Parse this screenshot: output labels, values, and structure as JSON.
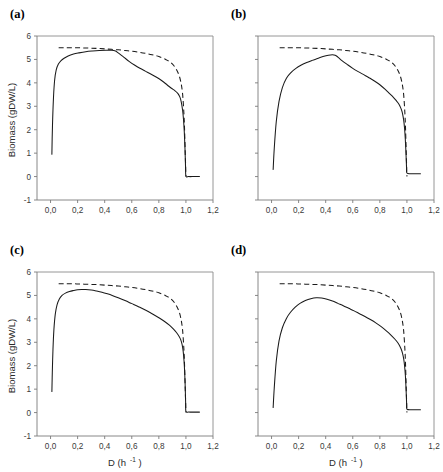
{
  "figure": {
    "name": "biomass-vs-dilution-rate-four-panel",
    "panels": [
      "a",
      "b",
      "c",
      "d"
    ]
  },
  "labels": {
    "panel_a": "(a)",
    "panel_b": "(b)",
    "panel_c": "(c)",
    "panel_d": "(d)",
    "ylabel": "Biomass (gDW/L)",
    "xlabel_base": "D (h",
    "xlabel_sup": "-1",
    "xlabel_close": ")",
    "xlabel_full": "D (h-1)"
  },
  "axes": {
    "ylim": [
      -1,
      6
    ],
    "yticks": [
      -1,
      0,
      1,
      2,
      3,
      4,
      5,
      6
    ],
    "ytick_labels": [
      "-1",
      "0",
      "1",
      "2",
      "3",
      "4",
      "5",
      "6"
    ],
    "xlim": [
      -0.1,
      1.2
    ],
    "xticks": [
      0.0,
      0.2,
      0.4,
      0.6,
      0.8,
      1.0,
      1.2
    ],
    "xtick_labels": [
      "0,0",
      "0,2",
      "0,4",
      "0,6",
      "0,8",
      "1,0",
      "1,2"
    ],
    "grid": false,
    "legend": "none",
    "decimal_separator": ","
  },
  "style": {
    "line_color": "#1a1a1a",
    "frame_color": "#8a8a8a",
    "background": "#ffffff"
  },
  "chart_data": [
    {
      "id": "a",
      "type": "line",
      "title": "(a)",
      "xlabel": "D (h-1)",
      "ylabel": "Biomass (gDW/L)",
      "xlim": [
        -0.1,
        1.2
      ],
      "ylim": [
        -1,
        6
      ],
      "grid": false,
      "legend": "none",
      "series": [
        {
          "name": "dashed-reference",
          "style": "dashed",
          "x": [
            0.06,
            0.1,
            0.15,
            0.2,
            0.25,
            0.3,
            0.35,
            0.4,
            0.45,
            0.5,
            0.55,
            0.6,
            0.65,
            0.7,
            0.75,
            0.8,
            0.85,
            0.88,
            0.91,
            0.94,
            0.96,
            0.975,
            0.985,
            0.99,
            0.995,
            1.0
          ],
          "y": [
            5.5,
            5.5,
            5.5,
            5.5,
            5.49,
            5.48,
            5.47,
            5.45,
            5.43,
            5.41,
            5.38,
            5.35,
            5.31,
            5.26,
            5.2,
            5.12,
            5.0,
            4.9,
            4.74,
            4.45,
            4.1,
            3.55,
            2.7,
            2.0,
            1.0,
            0.0
          ]
        },
        {
          "name": "solid-model",
          "style": "solid",
          "x": [
            0.01,
            0.012,
            0.016,
            0.022,
            0.03,
            0.042,
            0.058,
            0.078,
            0.1,
            0.13,
            0.17,
            0.21,
            0.26,
            0.31,
            0.36,
            0.41,
            0.45,
            0.48,
            0.5,
            0.54,
            0.58,
            0.62,
            0.66,
            0.7,
            0.74,
            0.78,
            0.82,
            0.86,
            0.89,
            0.92,
            0.94,
            0.955,
            0.965,
            0.975,
            0.982,
            0.988,
            0.993,
            0.997,
            1.0,
            1.02,
            1.06,
            1.1
          ],
          "y": [
            0.95,
            1.6,
            2.5,
            3.4,
            4.1,
            4.55,
            4.8,
            4.95,
            5.05,
            5.15,
            5.23,
            5.28,
            5.33,
            5.36,
            5.38,
            5.39,
            5.39,
            5.36,
            5.28,
            5.1,
            4.92,
            4.76,
            4.62,
            4.5,
            4.38,
            4.25,
            4.1,
            3.92,
            3.78,
            3.66,
            3.55,
            3.4,
            3.2,
            2.85,
            2.45,
            1.9,
            1.2,
            0.45,
            0.02,
            0.0,
            0.0,
            0.0
          ]
        }
      ]
    },
    {
      "id": "b",
      "type": "line",
      "title": "(b)",
      "xlabel": "D (h-1)",
      "ylabel": "Biomass (gDW/L)",
      "xlim": [
        -0.1,
        1.2
      ],
      "ylim": [
        -1,
        6
      ],
      "grid": false,
      "legend": "none",
      "series": [
        {
          "name": "dashed-reference",
          "style": "dashed",
          "x": [
            0.06,
            0.1,
            0.15,
            0.2,
            0.25,
            0.3,
            0.35,
            0.4,
            0.45,
            0.5,
            0.55,
            0.6,
            0.65,
            0.7,
            0.75,
            0.8,
            0.85,
            0.88,
            0.91,
            0.94,
            0.96,
            0.975,
            0.985,
            0.99,
            0.995,
            1.0
          ],
          "y": [
            5.5,
            5.5,
            5.5,
            5.5,
            5.49,
            5.48,
            5.47,
            5.45,
            5.43,
            5.41,
            5.38,
            5.35,
            5.31,
            5.26,
            5.2,
            5.12,
            5.0,
            4.9,
            4.74,
            4.45,
            4.1,
            3.55,
            2.7,
            2.0,
            1.0,
            0.0
          ]
        },
        {
          "name": "solid-model",
          "style": "solid",
          "x": [
            0.012,
            0.02,
            0.035,
            0.055,
            0.08,
            0.11,
            0.145,
            0.18,
            0.22,
            0.26,
            0.3,
            0.34,
            0.38,
            0.42,
            0.45,
            0.47,
            0.49,
            0.52,
            0.56,
            0.6,
            0.64,
            0.68,
            0.72,
            0.76,
            0.8,
            0.84,
            0.87,
            0.9,
            0.92,
            0.94,
            0.955,
            0.965,
            0.975,
            0.982,
            0.988,
            0.993,
            0.997,
            1.0,
            1.03,
            1.06,
            1.1
          ],
          "y": [
            0.3,
            1.2,
            2.35,
            3.2,
            3.8,
            4.2,
            4.45,
            4.62,
            4.76,
            4.87,
            4.96,
            5.04,
            5.12,
            5.18,
            5.2,
            5.18,
            5.1,
            4.95,
            4.78,
            4.62,
            4.48,
            4.35,
            4.22,
            4.08,
            3.92,
            3.72,
            3.55,
            3.38,
            3.25,
            3.1,
            2.92,
            2.75,
            2.45,
            2.1,
            1.6,
            1.0,
            0.4,
            0.15,
            0.12,
            0.12,
            0.12
          ]
        }
      ]
    },
    {
      "id": "c",
      "type": "line",
      "title": "(c)",
      "xlabel": "D (h-1)",
      "ylabel": "Biomass (gDW/L)",
      "xlim": [
        -0.1,
        1.2
      ],
      "ylim": [
        -1,
        6
      ],
      "grid": false,
      "legend": "none",
      "series": [
        {
          "name": "dashed-reference",
          "style": "dashed",
          "x": [
            0.06,
            0.1,
            0.15,
            0.2,
            0.25,
            0.3,
            0.35,
            0.4,
            0.45,
            0.5,
            0.55,
            0.6,
            0.65,
            0.7,
            0.75,
            0.8,
            0.85,
            0.88,
            0.91,
            0.94,
            0.96,
            0.975,
            0.985,
            0.99,
            0.995,
            1.0
          ],
          "y": [
            5.5,
            5.5,
            5.5,
            5.49,
            5.48,
            5.47,
            5.46,
            5.44,
            5.42,
            5.4,
            5.37,
            5.34,
            5.3,
            5.25,
            5.19,
            5.11,
            4.99,
            4.89,
            4.73,
            4.44,
            4.09,
            3.54,
            2.7,
            2.0,
            1.0,
            0.0
          ]
        },
        {
          "name": "solid-model",
          "style": "solid",
          "x": [
            0.01,
            0.013,
            0.018,
            0.025,
            0.035,
            0.048,
            0.065,
            0.085,
            0.11,
            0.14,
            0.17,
            0.2,
            0.23,
            0.26,
            0.3,
            0.34,
            0.38,
            0.42,
            0.46,
            0.5,
            0.55,
            0.6,
            0.65,
            0.7,
            0.75,
            0.8,
            0.84,
            0.88,
            0.91,
            0.93,
            0.95,
            0.962,
            0.972,
            0.98,
            0.986,
            0.991,
            0.995,
            0.998,
            1.0,
            1.02,
            1.06,
            1.1
          ],
          "y": [
            0.9,
            1.7,
            2.7,
            3.55,
            4.2,
            4.6,
            4.85,
            5.0,
            5.1,
            5.17,
            5.21,
            5.24,
            5.25,
            5.25,
            5.23,
            5.19,
            5.14,
            5.07,
            4.99,
            4.9,
            4.78,
            4.65,
            4.52,
            4.38,
            4.22,
            4.05,
            3.9,
            3.72,
            3.55,
            3.42,
            3.25,
            3.1,
            2.9,
            2.6,
            2.2,
            1.7,
            1.05,
            0.4,
            0.05,
            0.02,
            0.02,
            0.02
          ]
        }
      ]
    },
    {
      "id": "d",
      "type": "line",
      "title": "(d)",
      "xlabel": "D (h-1)",
      "ylabel": "Biomass (gDW/L)",
      "xlim": [
        -0.1,
        1.2
      ],
      "ylim": [
        -1,
        6
      ],
      "grid": false,
      "legend": "none",
      "series": [
        {
          "name": "dashed-reference",
          "style": "dashed",
          "x": [
            0.06,
            0.1,
            0.15,
            0.2,
            0.25,
            0.3,
            0.35,
            0.4,
            0.45,
            0.5,
            0.55,
            0.6,
            0.65,
            0.7,
            0.75,
            0.8,
            0.85,
            0.88,
            0.91,
            0.94,
            0.96,
            0.975,
            0.985,
            0.99,
            0.995,
            1.0
          ],
          "y": [
            5.5,
            5.5,
            5.5,
            5.49,
            5.48,
            5.47,
            5.46,
            5.44,
            5.42,
            5.4,
            5.37,
            5.34,
            5.3,
            5.25,
            5.19,
            5.11,
            4.99,
            4.89,
            4.73,
            4.44,
            4.09,
            3.54,
            2.7,
            2.0,
            1.0,
            0.0
          ]
        },
        {
          "name": "solid-model",
          "style": "solid",
          "x": [
            0.012,
            0.02,
            0.035,
            0.055,
            0.08,
            0.11,
            0.14,
            0.175,
            0.21,
            0.25,
            0.29,
            0.33,
            0.37,
            0.41,
            0.45,
            0.49,
            0.53,
            0.57,
            0.61,
            0.65,
            0.69,
            0.73,
            0.77,
            0.81,
            0.85,
            0.88,
            0.91,
            0.93,
            0.945,
            0.958,
            0.968,
            0.976,
            0.983,
            0.989,
            0.994,
            0.998,
            1.0,
            1.03,
            1.06,
            1.1
          ],
          "y": [
            0.22,
            1.05,
            2.2,
            3.05,
            3.62,
            4.02,
            4.28,
            4.5,
            4.66,
            4.78,
            4.86,
            4.9,
            4.89,
            4.84,
            4.76,
            4.66,
            4.56,
            4.45,
            4.34,
            4.22,
            4.1,
            3.97,
            3.83,
            3.67,
            3.48,
            3.32,
            3.14,
            3.0,
            2.86,
            2.7,
            2.52,
            2.3,
            1.98,
            1.55,
            0.95,
            0.35,
            0.15,
            0.12,
            0.12,
            0.12
          ]
        }
      ]
    }
  ]
}
